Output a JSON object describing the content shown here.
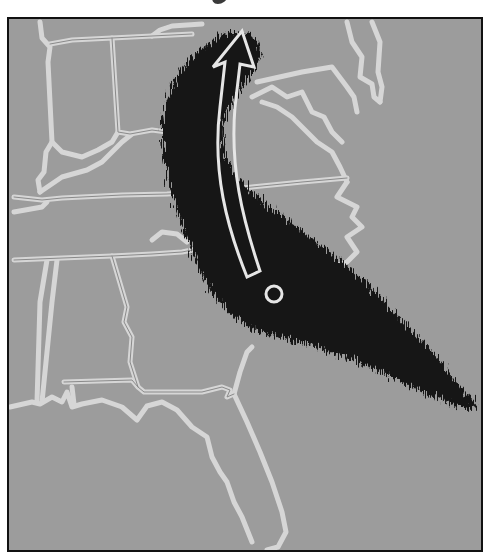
{
  "title_remnant": {
    "visible": "partially cropped heading above map (unreadable)"
  },
  "map": {
    "region": "Southeastern United States",
    "background_color": "#9c9c9c",
    "border_color": "#d8d8d8",
    "frame_color": "#111111",
    "storm_band": {
      "color": "#141414",
      "description": "dark feathery storm band sweeping from the Atlantic off Georgia/Carolinas northward over the Appalachians"
    },
    "arrow": {
      "direction": "north",
      "stroke_color": "#e6e6e6",
      "description": "curved outlined arrow indicating northward track"
    },
    "center_marker": {
      "shape": "circle",
      "stroke_color": "#e6e6e6"
    }
  }
}
